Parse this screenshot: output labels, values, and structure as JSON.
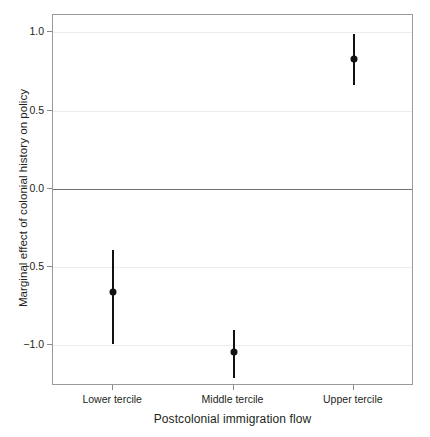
{
  "chart_data": {
    "type": "scatter",
    "title": "",
    "xlabel": "Postcolonial immigration flow",
    "ylabel": "Marginal effect of colonial history on policy",
    "categories": [
      "Lower tercile",
      "Middle tercile",
      "Upper tercile"
    ],
    "values": [
      -0.66,
      -1.04,
      0.83
    ],
    "ci_low": [
      -0.99,
      -1.21,
      0.66
    ],
    "ci_high": [
      -0.39,
      -0.9,
      0.99
    ],
    "ylim": [
      -1.26,
      1.11
    ],
    "yticks": [
      1.0,
      0.5,
      0.0,
      -0.5,
      -1.0
    ],
    "ytick_labels": [
      "1.0",
      "0.5",
      "0.0",
      "−0.5",
      "−1.0"
    ],
    "grid": "horizontal",
    "legend": "none",
    "zero_reference_line": 0.0,
    "series": [
      {
        "name": "Marginal effect",
        "points": [
          {
            "category": "Lower tercile",
            "estimate": -0.66,
            "lower": -0.99,
            "upper": -0.39
          },
          {
            "category": "Middle tercile",
            "estimate": -1.04,
            "lower": -1.21,
            "upper": -0.9
          },
          {
            "category": "Upper tercile",
            "estimate": 0.83,
            "lower": 0.66,
            "upper": 0.99
          }
        ]
      }
    ],
    "colors": {
      "point": "#111111",
      "errorbar": "#111111",
      "gridline": "#ededed",
      "zero_line": "#6f6f6f",
      "panel_border": "#9a9a9a",
      "text": "#231f20",
      "background": "#ffffff"
    }
  },
  "axes": {
    "y_title": "Marginal effect of colonial history on policy",
    "x_title": "Postcolonial immigration flow",
    "y_tick_labels": [
      "1.0",
      "0.5",
      "0.0",
      "−0.5",
      "−1.0"
    ],
    "x_tick_labels": [
      "Lower tercile",
      "Middle tercile",
      "Upper tercile"
    ]
  }
}
